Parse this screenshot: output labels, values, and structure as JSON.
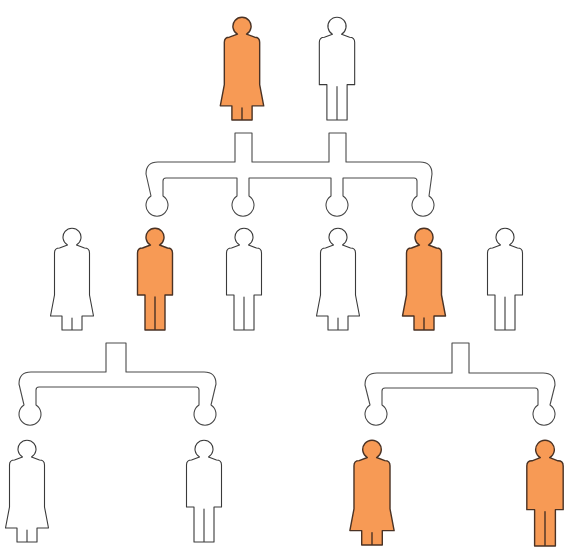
{
  "diagram": {
    "type": "pedigree",
    "colors": {
      "affected_fill": "#F79A55",
      "unaffected_fill": "#ffffff",
      "affected_stroke": "#4a3224",
      "unaffected_stroke": "#3a3a3a",
      "connector_stroke": "#4a4a4a",
      "background": "#ffffff"
    },
    "generations": [
      {
        "id": "gen-1",
        "individuals": [
          {
            "id": "g1-female",
            "sex": "female",
            "affected": true,
            "cx": 242,
            "top": 17,
            "bottom": 120
          },
          {
            "id": "g1-male",
            "sex": "male",
            "affected": false,
            "cx": 337,
            "top": 17,
            "bottom": 120
          }
        ]
      },
      {
        "id": "gen-2",
        "individuals": [
          {
            "id": "g2-1-female",
            "sex": "female",
            "affected": false,
            "cx": 72,
            "top": 228,
            "bottom": 330
          },
          {
            "id": "g2-2-male",
            "sex": "male",
            "affected": true,
            "cx": 155,
            "top": 228,
            "bottom": 330
          },
          {
            "id": "g2-3-male",
            "sex": "male",
            "affected": false,
            "cx": 244,
            "top": 228,
            "bottom": 330
          },
          {
            "id": "g2-4-female",
            "sex": "female",
            "affected": false,
            "cx": 338,
            "top": 228,
            "bottom": 330
          },
          {
            "id": "g2-5-female",
            "sex": "female",
            "affected": true,
            "cx": 424,
            "top": 228,
            "bottom": 330
          },
          {
            "id": "g2-6-male",
            "sex": "male",
            "affected": false,
            "cx": 505,
            "top": 228,
            "bottom": 330
          }
        ]
      },
      {
        "id": "gen-3",
        "individuals": [
          {
            "id": "g3-1-female",
            "sex": "female",
            "affected": false,
            "cx": 27,
            "top": 440,
            "bottom": 542
          },
          {
            "id": "g3-2-male",
            "sex": "male",
            "affected": false,
            "cx": 204,
            "top": 440,
            "bottom": 542
          },
          {
            "id": "g3-3-female",
            "sex": "female",
            "affected": true,
            "cx": 372,
            "top": 440,
            "bottom": 545
          },
          {
            "id": "g3-4-male",
            "sex": "male",
            "affected": true,
            "cx": 545,
            "top": 440,
            "bottom": 546
          }
        ]
      }
    ],
    "connectors": [
      {
        "id": "connector-gen1-to-gen2",
        "stubs": [
          [
            235,
            252
          ],
          [
            329,
            346
          ]
        ],
        "stub_top": 133,
        "bar_top": 162,
        "bar_bottom": 178,
        "left": 146,
        "right": 432,
        "drops": [
          157,
          243,
          337,
          423
        ],
        "knob_cy": 205,
        "knob_r": 11
      },
      {
        "id": "connector-gen2-left-to-gen3",
        "stubs": [
          [
            106,
            126
          ]
        ],
        "stub_top": 343,
        "bar_top": 372,
        "bar_bottom": 387,
        "left": 19,
        "right": 216,
        "drops": [
          30,
          205
        ],
        "knob_cy": 414,
        "knob_r": 11
      },
      {
        "id": "connector-gen2-right-to-gen3",
        "stubs": [
          [
            452,
            469
          ]
        ],
        "stub_top": 343,
        "bar_top": 373,
        "bar_bottom": 388,
        "left": 365,
        "right": 555,
        "drops": [
          376,
          544
        ],
        "knob_cy": 414,
        "knob_r": 11
      }
    ]
  }
}
